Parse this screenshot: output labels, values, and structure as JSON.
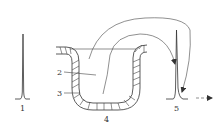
{
  "diagram": {
    "type": "flow-path schematic",
    "labels": {
      "l1": "1",
      "l2": "2",
      "l3": "3",
      "l4": "4",
      "l5": "5"
    },
    "components": [
      {
        "id": "1",
        "description": "input peak (narrow)"
      },
      {
        "id": "2",
        "description": "channel interior / flow region"
      },
      {
        "id": "3",
        "description": "hatched wall / packing layer"
      },
      {
        "id": "4",
        "description": "U-shaped bend of the channel"
      },
      {
        "id": "5",
        "description": "output peak (broadened, with tail)"
      }
    ],
    "colors": {
      "stroke": "#333333",
      "background": "#ffffff"
    }
  }
}
